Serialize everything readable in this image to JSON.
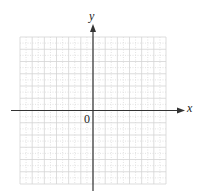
{
  "diagram": {
    "type": "cartesian-coordinate-grid",
    "axes": {
      "x_label": "x",
      "y_label": "y",
      "origin_label": "0"
    },
    "grid": {
      "cells_x": 12,
      "cells_y": 12,
      "cells_left_of_origin": 6,
      "cells_right_of_origin": 6,
      "cells_above_origin": 6,
      "cells_below_origin": 6,
      "major_line_color": "#d4d4d4",
      "minor_line_style": "dotted",
      "minor_line_color": "#dcdcdc"
    },
    "colors": {
      "axis": "#333333",
      "background": "#ffffff",
      "label": "#222222"
    }
  }
}
